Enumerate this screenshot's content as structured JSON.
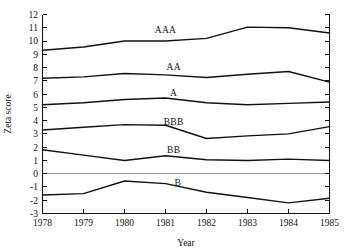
{
  "chart_data": {
    "type": "line",
    "title": "",
    "xlabel": "Year",
    "ylabel": "Zeta score",
    "x": [
      1978,
      1979,
      1980,
      1981,
      1982,
      1983,
      1984,
      1985
    ],
    "xticklabels": [
      "1978",
      "1979",
      "1980",
      "1981",
      "1982",
      "1983",
      "1984",
      "1985"
    ],
    "xlim": [
      1978,
      1985
    ],
    "ylim": [
      -3,
      12
    ],
    "yticks": [
      -3,
      -2,
      -1,
      0,
      1,
      2,
      3,
      4,
      5,
      6,
      7,
      8,
      9,
      10,
      11,
      12
    ],
    "yticklabels": [
      "-3",
      "-2",
      "-1",
      "0",
      "1",
      "2",
      "3",
      "4",
      "5",
      "6",
      "7",
      "8",
      "9",
      "10",
      "11",
      "12"
    ],
    "grid": false,
    "legend_position": "inline-labels",
    "zero_line": 0,
    "series": [
      {
        "name": "AAA",
        "values": [
          9.3,
          9.55,
          10.0,
          10.0,
          10.2,
          11.05,
          11.0,
          10.6
        ],
        "label_x": 1981.0,
        "label_y": 10.85
      },
      {
        "name": "AA",
        "values": [
          7.2,
          7.3,
          7.55,
          7.45,
          7.25,
          7.5,
          7.7,
          6.9
        ],
        "label_x": 1981.2,
        "label_y": 8.05
      },
      {
        "name": "A",
        "values": [
          5.2,
          5.35,
          5.6,
          5.7,
          5.35,
          5.2,
          5.3,
          5.4
        ],
        "label_x": 1981.2,
        "label_y": 6.1
      },
      {
        "name": "BBB",
        "values": [
          3.3,
          3.5,
          3.7,
          3.65,
          2.65,
          2.85,
          3.0,
          3.55
        ],
        "label_x": 1981.2,
        "label_y": 3.95
      },
      {
        "name": "BB",
        "values": [
          1.8,
          1.4,
          1.0,
          1.35,
          1.05,
          1.0,
          1.1,
          1.0
        ],
        "label_x": 1981.2,
        "label_y": 1.85
      },
      {
        "name": "B",
        "values": [
          -1.6,
          -1.5,
          -0.55,
          -0.75,
          -1.4,
          -1.8,
          -2.2,
          -1.85
        ],
        "label_x": 1981.3,
        "label_y": -0.65
      }
    ]
  }
}
